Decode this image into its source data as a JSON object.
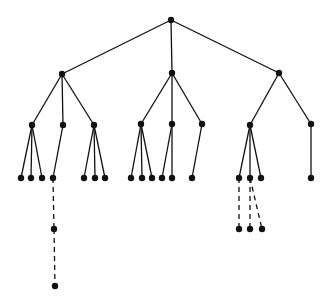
{
  "diagram": {
    "type": "tree",
    "background": "#ffffff",
    "ink": "#111111",
    "nodes": [
      {
        "id": "root",
        "x": 171,
        "y": 20
      },
      {
        "id": "a",
        "x": 62,
        "y": 74
      },
      {
        "id": "b",
        "x": 172,
        "y": 73
      },
      {
        "id": "c",
        "x": 279,
        "y": 73
      },
      {
        "id": "a1",
        "x": 32,
        "y": 125
      },
      {
        "id": "a2",
        "x": 63,
        "y": 125
      },
      {
        "id": "a3",
        "x": 94,
        "y": 125
      },
      {
        "id": "b1",
        "x": 141,
        "y": 124
      },
      {
        "id": "b2",
        "x": 172,
        "y": 124
      },
      {
        "id": "b3",
        "x": 202,
        "y": 124
      },
      {
        "id": "c1",
        "x": 250,
        "y": 125
      },
      {
        "id": "c2",
        "x": 311,
        "y": 124
      },
      {
        "id": "a1x",
        "x": 21,
        "y": 178
      },
      {
        "id": "a1y",
        "x": 31,
        "y": 178
      },
      {
        "id": "a1z",
        "x": 42,
        "y": 178
      },
      {
        "id": "a2x",
        "x": 53,
        "y": 178
      },
      {
        "id": "a3x",
        "x": 84,
        "y": 178
      },
      {
        "id": "a3y",
        "x": 95,
        "y": 178
      },
      {
        "id": "a3z",
        "x": 105,
        "y": 178
      },
      {
        "id": "b1x",
        "x": 131,
        "y": 178
      },
      {
        "id": "b1y",
        "x": 142,
        "y": 178
      },
      {
        "id": "b1z",
        "x": 152,
        "y": 178
      },
      {
        "id": "b2x",
        "x": 162,
        "y": 178
      },
      {
        "id": "b2y",
        "x": 172,
        "y": 178
      },
      {
        "id": "b3x",
        "x": 192,
        "y": 178
      },
      {
        "id": "c1x",
        "x": 239,
        "y": 178
      },
      {
        "id": "c1y",
        "x": 250,
        "y": 178
      },
      {
        "id": "c1z",
        "x": 261,
        "y": 178
      },
      {
        "id": "c2x",
        "x": 311,
        "y": 178
      },
      {
        "id": "a2x1",
        "x": 54,
        "y": 229
      },
      {
        "id": "a2x2",
        "x": 55,
        "y": 286
      },
      {
        "id": "c1x1",
        "x": 239,
        "y": 229
      },
      {
        "id": "c1y1",
        "x": 250,
        "y": 229
      },
      {
        "id": "c1y2",
        "x": 262,
        "y": 229
      }
    ],
    "edges": [
      {
        "from": "root",
        "to": "a",
        "style": "solid"
      },
      {
        "from": "root",
        "to": "b",
        "style": "solid"
      },
      {
        "from": "root",
        "to": "c",
        "style": "solid"
      },
      {
        "from": "a",
        "to": "a1",
        "style": "solid"
      },
      {
        "from": "a",
        "to": "a2",
        "style": "solid"
      },
      {
        "from": "a",
        "to": "a3",
        "style": "solid"
      },
      {
        "from": "b",
        "to": "b1",
        "style": "solid"
      },
      {
        "from": "b",
        "to": "b2",
        "style": "solid"
      },
      {
        "from": "b",
        "to": "b3",
        "style": "solid"
      },
      {
        "from": "c",
        "to": "c1",
        "style": "solid"
      },
      {
        "from": "c",
        "to": "c2",
        "style": "solid"
      },
      {
        "from": "a1",
        "to": "a1x",
        "style": "solid"
      },
      {
        "from": "a1",
        "to": "a1y",
        "style": "solid"
      },
      {
        "from": "a1",
        "to": "a1z",
        "style": "solid"
      },
      {
        "from": "a2",
        "to": "a2x",
        "style": "solid"
      },
      {
        "from": "a3",
        "to": "a3x",
        "style": "solid"
      },
      {
        "from": "a3",
        "to": "a3y",
        "style": "solid"
      },
      {
        "from": "a3",
        "to": "a3z",
        "style": "solid"
      },
      {
        "from": "b1",
        "to": "b1x",
        "style": "solid"
      },
      {
        "from": "b1",
        "to": "b1y",
        "style": "solid"
      },
      {
        "from": "b1",
        "to": "b1z",
        "style": "solid"
      },
      {
        "from": "b2",
        "to": "b2x",
        "style": "solid"
      },
      {
        "from": "b2",
        "to": "b2y",
        "style": "solid"
      },
      {
        "from": "b3",
        "to": "b3x",
        "style": "solid"
      },
      {
        "from": "c1",
        "to": "c1x",
        "style": "solid"
      },
      {
        "from": "c1",
        "to": "c1y",
        "style": "solid"
      },
      {
        "from": "c1",
        "to": "c1z",
        "style": "solid"
      },
      {
        "from": "c2",
        "to": "c2x",
        "style": "solid"
      },
      {
        "from": "a2x",
        "to": "a2x1",
        "style": "dashed"
      },
      {
        "from": "a2x1",
        "to": "a2x2",
        "style": "dashed"
      },
      {
        "from": "c1x",
        "to": "c1x1",
        "style": "dashed"
      },
      {
        "from": "c1y",
        "to": "c1y1",
        "style": "dashed"
      },
      {
        "from": "c1y",
        "to": "c1y2",
        "style": "dashed"
      }
    ],
    "node_radius": 3.2
  }
}
